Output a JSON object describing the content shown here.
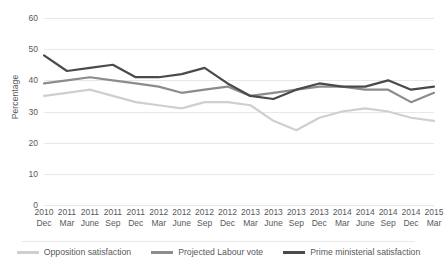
{
  "chart_data": {
    "type": "line",
    "title": "",
    "xlabel": "",
    "ylabel": "Percentage",
    "ylim": [
      0,
      60
    ],
    "ytick_step": 10,
    "yticks": [
      "60",
      "50",
      "40",
      "30",
      "20",
      "10",
      "0"
    ],
    "grid": true,
    "legend_position": "bottom",
    "categories": [
      "2010 Dec",
      "2011 Mar",
      "2011 June",
      "2011 Sep",
      "2011 Dec",
      "2012 Mar",
      "2012 June",
      "2012 Sep",
      "2012 Dec",
      "2013 Mar",
      "2013 June",
      "2013 Sep",
      "2013 Dec",
      "2014 Mar",
      "2014 June",
      "2014 Sep",
      "2014 Dec",
      "2015 Mar"
    ],
    "category_years": [
      "2010",
      "2011",
      "2011",
      "2011",
      "2011",
      "2012",
      "2012",
      "2012",
      "2012",
      "2013",
      "2013",
      "2013",
      "2013",
      "2014",
      "2014",
      "2014",
      "2014",
      "2015"
    ],
    "category_months": [
      "Dec",
      "Mar",
      "June",
      "Sep",
      "Dec",
      "Mar",
      "June",
      "Sep",
      "Dec",
      "Mar",
      "June",
      "Sep",
      "Dec",
      "Mar",
      "June",
      "Sep",
      "Dec",
      "Mar"
    ],
    "series": [
      {
        "name": "Opposition satisfaction",
        "color": "#cfcfcf",
        "values": [
          35,
          36,
          37,
          35,
          33,
          32,
          31,
          33,
          33,
          32,
          27,
          24,
          28,
          30,
          31,
          30,
          28,
          27
        ]
      },
      {
        "name": "Projected Labour vote",
        "color": "#8c8c8c",
        "values": [
          39,
          40,
          41,
          40,
          39,
          38,
          36,
          37,
          38,
          35,
          36,
          37,
          38,
          38,
          37,
          37,
          33,
          36
        ]
      },
      {
        "name": "Prime ministerial satisfaction",
        "color": "#4a4a4a",
        "values": [
          48,
          43,
          44,
          45,
          41,
          41,
          42,
          44,
          39,
          35,
          34,
          37,
          39,
          38,
          38,
          40,
          37,
          38
        ]
      }
    ]
  },
  "legend": {
    "items": [
      {
        "label": "Opposition satisfaction",
        "color": "#cfcfcf"
      },
      {
        "label": "Projected Labour vote",
        "color": "#8c8c8c"
      },
      {
        "label": "Prime ministerial satisfaction",
        "color": "#4a4a4a"
      }
    ]
  }
}
